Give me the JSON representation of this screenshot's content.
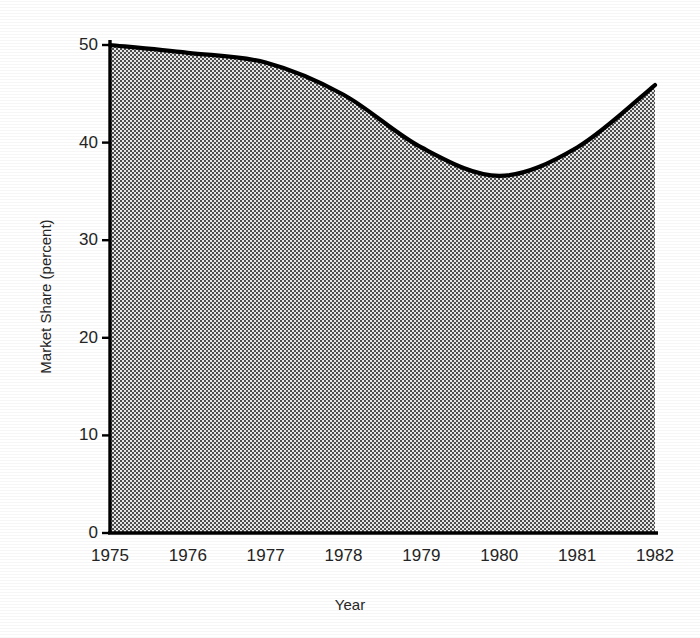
{
  "chart_data": {
    "type": "area",
    "title": "",
    "xlabel": "Year",
    "ylabel": "Market Share (percent)",
    "categories": [
      "1975",
      "1976",
      "1977",
      "1978",
      "1979",
      "1980",
      "1981",
      "1982"
    ],
    "x": [
      1975,
      1976,
      1977,
      1978,
      1979,
      1980,
      1981,
      1982
    ],
    "values": [
      50.0,
      49.2,
      48.2,
      44.9,
      39.5,
      36.6,
      39.5,
      45.9
    ],
    "series": [
      {
        "name": "Market Share",
        "values": [
          50.0,
          49.2,
          48.2,
          44.9,
          39.5,
          36.6,
          39.5,
          45.9
        ]
      }
    ],
    "xlim": [
      1975,
      1982
    ],
    "ylim": [
      0,
      50
    ],
    "yticks": [
      0,
      10,
      20,
      30,
      40,
      50
    ],
    "ytick_labels": [
      "0",
      "10",
      "20",
      "30",
      "40",
      "50"
    ],
    "xticks": [
      1975,
      1976,
      1977,
      1978,
      1979,
      1980,
      1981,
      1982
    ],
    "xtick_labels": [
      "1975",
      "1976",
      "1977",
      "1978",
      "1979",
      "1980",
      "1981",
      "1982"
    ],
    "grid": false,
    "legend": false,
    "legend_position": "none",
    "annotations": [],
    "style": {
      "line_color": "#000000",
      "line_width": 4,
      "fill_pattern": "checkerboard-halftone",
      "fill_color_dark": "#555555",
      "fill_color_light": "#e2e2e2",
      "axis_color": "#000000",
      "background": "#ffffff"
    }
  },
  "axes": {
    "y_title": "Market Share (percent)",
    "x_title": "Year"
  }
}
